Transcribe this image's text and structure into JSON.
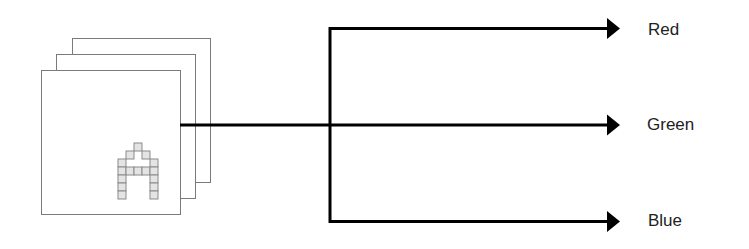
{
  "diagram": {
    "title": "",
    "input": {
      "description": "stack of three image channels with pixelated letter A",
      "page_count": 3,
      "glyph": "A",
      "glyph_grid": [
        [
          0,
          0,
          1,
          0,
          0
        ],
        [
          0,
          1,
          0,
          1,
          0
        ],
        [
          1,
          0,
          0,
          0,
          1
        ],
        [
          1,
          1,
          1,
          1,
          1
        ],
        [
          1,
          0,
          0,
          0,
          1
        ],
        [
          1,
          0,
          0,
          0,
          1
        ],
        [
          1,
          0,
          0,
          0,
          1
        ]
      ]
    },
    "outputs": [
      {
        "label": "Red"
      },
      {
        "label": "Green"
      },
      {
        "label": "Blue"
      }
    ],
    "colors": {
      "line": "#000000",
      "page_border": "#7a7a7a",
      "cell_fill": "#e4e4e4",
      "cell_border": "#8a8a8a",
      "label_text": "#222222"
    }
  }
}
